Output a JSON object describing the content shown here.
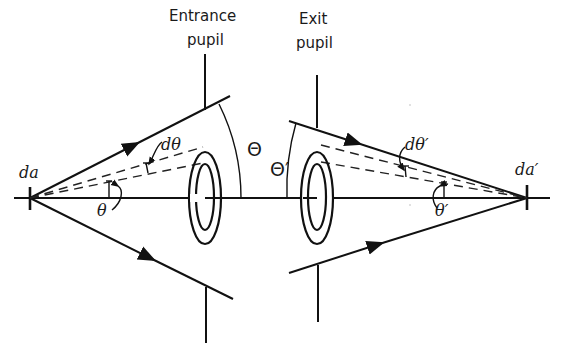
{
  "diagram": {
    "labels": {
      "entrance_pupil_line1": "Entrance",
      "entrance_pupil_line2": "pupil",
      "exit_pupil_line1": "Exit",
      "exit_pupil_line2": "pupil",
      "object_area": "da",
      "image_area": "da′",
      "object_cone_angle": "Θ",
      "image_cone_angle": "Θ′",
      "object_ray_angle": "θ",
      "image_ray_angle": "θ′",
      "object_d_angle": "dθ",
      "image_d_angle": "dθ′"
    },
    "elements": [
      {
        "name": "optical-axis",
        "type": "line"
      },
      {
        "name": "entrance-pupil",
        "type": "stop"
      },
      {
        "name": "exit-pupil",
        "type": "stop"
      },
      {
        "name": "entrance-annular-zone",
        "type": "ring"
      },
      {
        "name": "exit-annular-zone",
        "type": "ring"
      },
      {
        "name": "marginal-rays-object",
        "type": "ray-pair"
      },
      {
        "name": "marginal-rays-image",
        "type": "ray-pair"
      },
      {
        "name": "zone-rays-object",
        "type": "dashed-ray-pair"
      },
      {
        "name": "zone-rays-image",
        "type": "dashed-ray-pair"
      }
    ],
    "colors": {
      "ink": "#111111",
      "background": "#ffffff"
    }
  }
}
